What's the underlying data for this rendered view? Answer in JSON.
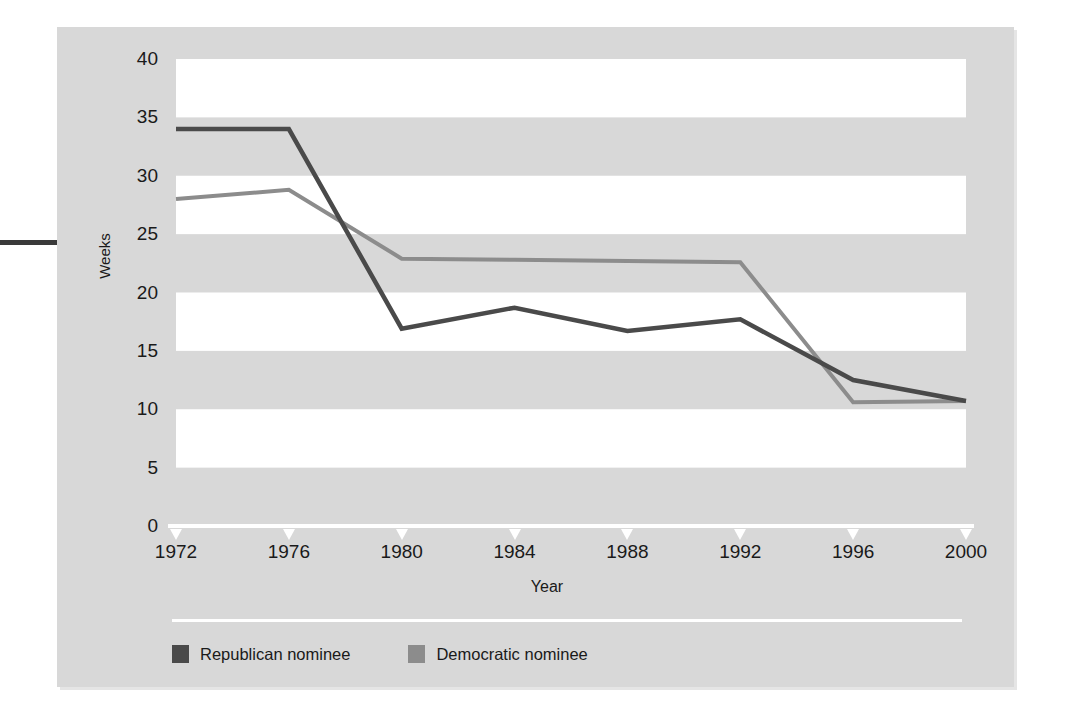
{
  "chart_data": {
    "type": "line",
    "title": "",
    "xlabel": "Year",
    "ylabel": "Weeks",
    "x": [
      1972,
      1976,
      1980,
      1984,
      1988,
      1992,
      1996,
      2000
    ],
    "xtick_labels": [
      "1972",
      "1976",
      "1980",
      "1984",
      "1988",
      "1992",
      "1996",
      "2000"
    ],
    "ytick_labels": [
      "0",
      "5",
      "10",
      "15",
      "20",
      "25",
      "30",
      "35",
      "40"
    ],
    "ytick_values": [
      0,
      5,
      10,
      15,
      20,
      25,
      30,
      35,
      40
    ],
    "xlim": [
      1972,
      2000
    ],
    "ylim": [
      0,
      40
    ],
    "grid": "alternating horizontal bands every 5 weeks",
    "legend_position": "below-plot-left",
    "series": [
      {
        "name": "Republican nominee",
        "color": "#4a4a4a",
        "values": [
          34.0,
          34.0,
          16.9,
          18.7,
          16.7,
          17.7,
          12.5,
          10.7
        ]
      },
      {
        "name": "Democratic nominee",
        "color": "#8c8c8c",
        "values": [
          28.0,
          28.8,
          22.9,
          22.8,
          22.7,
          22.6,
          10.6,
          10.7
        ]
      }
    ]
  },
  "legend": {
    "items": [
      {
        "label": "Republican nominee",
        "color": "#4a4a4a"
      },
      {
        "label": "Democratic nominee",
        "color": "#8c8c8c"
      }
    ]
  },
  "colors": {
    "panel_background": "#d8d8d8",
    "band_white": "#ffffff",
    "axis": "#ffffff",
    "text": "#1a1a1a",
    "republican": "#4a4a4a",
    "democratic": "#8c8c8c"
  }
}
